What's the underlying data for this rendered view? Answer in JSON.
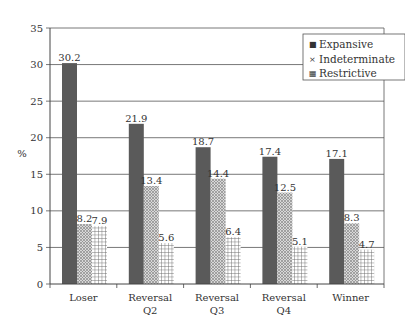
{
  "chart_data": {
    "type": "bar",
    "title": "",
    "xlabel": "",
    "ylabel": "%",
    "ylim": [
      0,
      35
    ],
    "yticks": [
      0,
      5,
      10,
      15,
      20,
      25,
      30,
      35
    ],
    "grid": true,
    "legend_position": "top-right",
    "categories": [
      "Loser",
      "Reversal Q2",
      "Reversal Q3",
      "Reversal Q4",
      "Winner"
    ],
    "category_lines": [
      [
        "Loser"
      ],
      [
        "Reversal",
        "Q2"
      ],
      [
        "Reversal",
        "Q3"
      ],
      [
        "Reversal",
        "Q4"
      ],
      [
        "Winner"
      ]
    ],
    "series": [
      {
        "name": "Expansive",
        "values": [
          30.2,
          21.9,
          18.7,
          17.4,
          17.1
        ],
        "pattern": "solid",
        "color": "#5a5a5a"
      },
      {
        "name": "Indeterminate",
        "values": [
          8.2,
          13.4,
          14.4,
          12.5,
          8.3
        ],
        "pattern": "crosshatch-fine",
        "color": "#b0b0b0"
      },
      {
        "name": "Restrictive",
        "values": [
          7.9,
          5.6,
          6.4,
          5.1,
          4.7
        ],
        "pattern": "grid",
        "color": "#8a8a8a"
      }
    ],
    "data_labels": true
  }
}
